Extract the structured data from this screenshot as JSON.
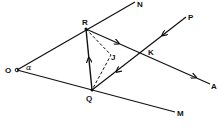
{
  "diagram": {
    "type": "geometry",
    "stroke_color": "#111111",
    "background": "#ffffff",
    "points": {
      "O": {
        "label": "O",
        "x": 17,
        "y": 70
      },
      "R": {
        "label": "R",
        "x": 86,
        "y": 29
      },
      "Q": {
        "label": "Q",
        "x": 92,
        "y": 90
      },
      "K": {
        "label": "K",
        "x": 141,
        "y": 53
      },
      "J": {
        "label": "J",
        "x": 111,
        "y": 55
      },
      "N": {
        "label": "N",
        "x": 135,
        "y": 1
      },
      "P": {
        "label": "P",
        "x": 186,
        "y": 17
      },
      "A": {
        "label": "A",
        "x": 210,
        "y": 84
      },
      "M": {
        "label": "M",
        "x": 175,
        "y": 112
      }
    },
    "angle_label": "α",
    "segments": [
      {
        "from": "O",
        "to": "N",
        "style": "solid"
      },
      {
        "from": "O",
        "to": "M",
        "style": "solid"
      },
      {
        "from": "R",
        "to": "A",
        "style": "solid",
        "arrows": 2
      },
      {
        "from": "P",
        "to": "Q",
        "style": "solid",
        "arrows": 2
      },
      {
        "from": "Q",
        "to": "R",
        "style": "solid",
        "arrows": 1
      },
      {
        "from": "R",
        "to": "J",
        "style": "dashed"
      },
      {
        "from": "J",
        "to": "Q",
        "style": "dashed"
      }
    ]
  }
}
